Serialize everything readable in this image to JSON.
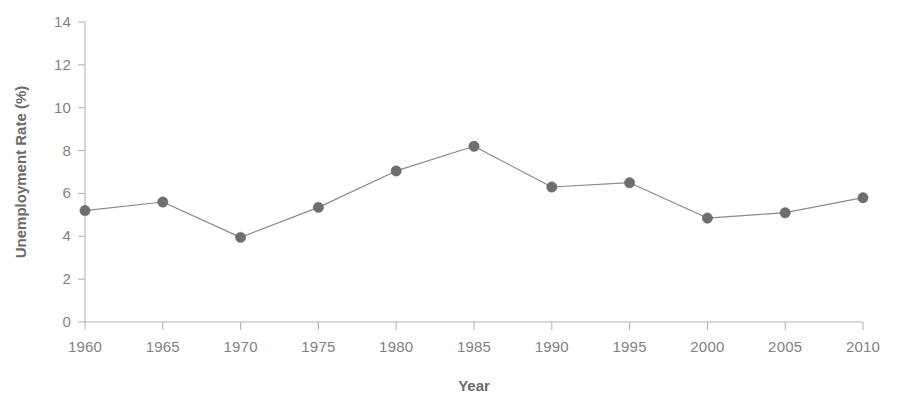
{
  "chart_data": {
    "type": "line",
    "title": "",
    "subtitle": "",
    "xlabel": "Year",
    "ylabel": "Unemployment Rate (%)",
    "x": [
      1960,
      1965,
      1970,
      1975,
      1980,
      1985,
      1990,
      1995,
      2000,
      2005,
      2010
    ],
    "values": [
      5.2,
      5.6,
      3.95,
      5.35,
      7.05,
      8.2,
      6.3,
      6.5,
      4.85,
      5.1,
      5.8
    ],
    "categories": [
      "1960",
      "1965",
      "1970",
      "1975",
      "1980",
      "1985",
      "1990",
      "1995",
      "2000",
      "2005",
      "2010"
    ],
    "xtick_labels": [
      "1960",
      "1965",
      "1970",
      "1975",
      "1980",
      "1985",
      "1990",
      "1995",
      "2000",
      "2005",
      "2010"
    ],
    "ytick_labels": [
      "0",
      "2",
      "4",
      "6",
      "8",
      "10",
      "12",
      "14"
    ],
    "yticks": [
      0,
      2,
      4,
      6,
      8,
      10,
      12,
      14
    ],
    "xlim": [
      1960,
      2010
    ],
    "ylim": [
      0,
      14
    ],
    "grid": false,
    "legend": null,
    "legend_position": "none",
    "series": [
      {
        "name": "Unemployment Rate (%)",
        "values": [
          5.2,
          5.6,
          3.95,
          5.35,
          7.05,
          8.2,
          6.3,
          6.5,
          4.85,
          5.1,
          5.8
        ],
        "marker": "circle",
        "line_color": "#8a8a8a",
        "marker_color": "#6e6e6e"
      }
    ],
    "colors": {
      "line": "#8a8a8a",
      "marker": "#6e6e6e",
      "axis": "#b4b4b4",
      "tick_label": "#828282",
      "axis_title": "#6b6b6b",
      "background": "#ffffff"
    }
  }
}
